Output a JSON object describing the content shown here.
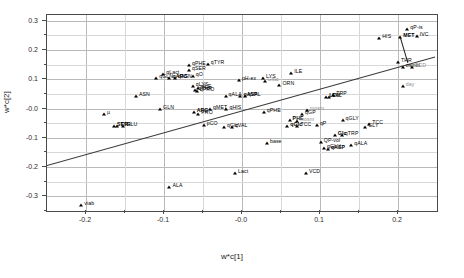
{
  "chart_data": {
    "type": "scatter",
    "title": "",
    "xlabel": "w*c[1]",
    "ylabel": "w*c[2]",
    "xlim": [
      -0.25,
      0.25
    ],
    "ylim": [
      -0.35,
      0.32
    ],
    "grid": true,
    "legend": "none",
    "xticks": [
      "-0.2",
      "-0.1",
      "-0.0",
      "0.1",
      "0.2"
    ],
    "xtick_values": [
      -0.2,
      -0.1,
      0.0,
      0.1,
      0.2
    ],
    "yticks": [
      "0.3",
      "0.2",
      "0.1",
      "-0.0",
      "-0.1",
      "-0.2",
      "-0.3"
    ],
    "ytick_values": [
      0.3,
      0.2,
      0.1,
      0.0,
      -0.1,
      -0.2,
      -0.3
    ],
    "annotations": {
      "trend_line": {
        "description": "diagonal regression line",
        "x_start": -0.25,
        "y_start": -0.2,
        "x_end": 0.25,
        "y_end": 0.175
      },
      "connector": {
        "description": "line segment connecting MET cluster to THR cluster",
        "x_start": 0.205,
        "y_start": 0.245,
        "x_end": 0.215,
        "y_end": 0.155
      }
    },
    "points": [
      {
        "label": "qP-is",
        "x": 0.212,
        "y": 0.272,
        "style": "plain"
      },
      {
        "label": "MET",
        "x": 0.203,
        "y": 0.245,
        "style": "bold"
      },
      {
        "label": "IVC",
        "x": 0.224,
        "y": 0.248,
        "style": "plain"
      },
      {
        "label": "HIS",
        "x": 0.176,
        "y": 0.243,
        "style": "plain"
      },
      {
        "label": "THR",
        "x": 0.2,
        "y": 0.158,
        "style": "plain"
      },
      {
        "label": "osmol",
        "x": 0.206,
        "y": 0.142,
        "style": "plain"
      },
      {
        "label": "TCD",
        "x": 0.218,
        "y": 0.142,
        "style": "grey"
      },
      {
        "label": "qTYR",
        "x": -0.044,
        "y": 0.152,
        "style": "plain"
      },
      {
        "label": "qPHE",
        "x": -0.068,
        "y": 0.15,
        "style": "plain"
      },
      {
        "label": "qSER",
        "x": -0.068,
        "y": 0.133,
        "style": "plain"
      },
      {
        "label": "qLact",
        "x": -0.101,
        "y": 0.118,
        "style": "plain"
      },
      {
        "label": "qO2",
        "x": -0.063,
        "y": 0.112,
        "style": "plain"
      },
      {
        "label": "qGLN",
        "x": -0.11,
        "y": 0.103,
        "style": "plain"
      },
      {
        "label": "qASN",
        "x": -0.086,
        "y": 0.103,
        "style": "plain"
      },
      {
        "label": "qARG",
        "x": -0.093,
        "y": 0.104,
        "style": "bold"
      },
      {
        "label": "ILE",
        "x": 0.063,
        "y": 0.122,
        "style": "plain"
      },
      {
        "label": "pH-ex",
        "x": -0.004,
        "y": 0.099,
        "style": "plain"
      },
      {
        "label": "LYS",
        "x": 0.027,
        "y": 0.103,
        "style": "plain"
      },
      {
        "label": "Gluc",
        "x": 0.029,
        "y": 0.094,
        "style": "grey"
      },
      {
        "label": "ORN",
        "x": 0.048,
        "y": 0.082,
        "style": "plain"
      },
      {
        "label": "qLYS",
        "x": -0.063,
        "y": 0.078,
        "style": "plain"
      },
      {
        "label": "qILE",
        "x": -0.057,
        "y": 0.07,
        "style": "plain"
      },
      {
        "label": "qTHR",
        "x": -0.06,
        "y": 0.064,
        "style": "plain"
      },
      {
        "label": "qPRO",
        "x": -0.058,
        "y": 0.059,
        "style": "plain"
      },
      {
        "label": "ASN",
        "x": -0.136,
        "y": 0.043,
        "style": "plain"
      },
      {
        "label": "qALA",
        "x": -0.021,
        "y": 0.042,
        "style": "plain"
      },
      {
        "label": "qASP",
        "x": -0.002,
        "y": 0.043,
        "style": "bold"
      },
      {
        "label": "qVAL",
        "x": 0.004,
        "y": 0.043,
        "style": "plain"
      },
      {
        "label": "TRP",
        "x": 0.117,
        "y": 0.046,
        "style": "plain"
      },
      {
        "label": "LEU",
        "x": 0.108,
        "y": 0.04,
        "style": "bold"
      },
      {
        "label": "VAL",
        "x": 0.112,
        "y": 0.04,
        "style": "plain"
      },
      {
        "label": "GLN",
        "x": -0.105,
        "y": -0.002,
        "style": "plain"
      },
      {
        "label": "qMET",
        "x": -0.041,
        "y": -0.002,
        "style": "plain"
      },
      {
        "label": "qHIS",
        "x": -0.02,
        "y": -0.002,
        "style": "plain"
      },
      {
        "label": "ARG",
        "x": -0.062,
        "y": -0.013,
        "style": "bold"
      },
      {
        "label": "PRO",
        "x": -0.056,
        "y": -0.017,
        "style": "plain"
      },
      {
        "label": "qPHE2",
        "x": 0.028,
        "y": -0.011,
        "style": "plain"
      },
      {
        "label": "mosm",
        "x": 0.083,
        "y": -0.004,
        "style": "grey"
      },
      {
        "label": "qGP",
        "x": 0.077,
        "y": -0.018,
        "style": "plain"
      },
      {
        "label": "µ",
        "x": -0.177,
        "y": -0.018,
        "style": "plain"
      },
      {
        "label": "SER",
        "x": -0.164,
        "y": -0.06,
        "style": "bold"
      },
      {
        "label": "TYR",
        "x": -0.16,
        "y": -0.058,
        "style": "plain"
      },
      {
        "label": "GLU",
        "x": -0.152,
        "y": -0.061,
        "style": "plain"
      },
      {
        "label": "pCO2",
        "x": -0.049,
        "y": -0.055,
        "style": "plain"
      },
      {
        "label": "qGlc",
        "x": -0.023,
        "y": -0.062,
        "style": "plain"
      },
      {
        "label": "qVAL2",
        "x": -0.013,
        "y": -0.064,
        "style": "plain"
      },
      {
        "label": "PHE",
        "x": 0.061,
        "y": -0.038,
        "style": "bold"
      },
      {
        "label": "mosm2",
        "x": 0.07,
        "y": -0.043,
        "style": "grey"
      },
      {
        "label": "qGlc2",
        "x": 0.058,
        "y": -0.058,
        "style": "bold"
      },
      {
        "label": "TCC",
        "x": 0.071,
        "y": -0.058,
        "style": "plain"
      },
      {
        "label": "qGLY",
        "x": 0.129,
        "y": -0.04,
        "style": "plain"
      },
      {
        "label": "TCC2",
        "x": 0.163,
        "y": -0.052,
        "style": "plain"
      },
      {
        "label": "GLY",
        "x": 0.158,
        "y": -0.062,
        "style": "plain"
      },
      {
        "label": "qP",
        "x": 0.096,
        "y": -0.057,
        "style": "plain"
      },
      {
        "label": "Glc",
        "x": 0.119,
        "y": -0.09,
        "style": "bold"
      },
      {
        "label": "qTRP",
        "x": 0.128,
        "y": -0.089,
        "style": "plain"
      },
      {
        "label": "QP-vol",
        "x": 0.101,
        "y": -0.113,
        "style": "plain"
      },
      {
        "label": "qALA2",
        "x": 0.14,
        "y": -0.124,
        "style": "plain"
      },
      {
        "label": "base",
        "x": 0.032,
        "y": -0.116,
        "style": "plain"
      },
      {
        "label": "qGLU",
        "x": 0.105,
        "y": -0.134,
        "style": "plain"
      },
      {
        "label": "qASP2",
        "x": 0.11,
        "y": -0.139,
        "style": "bold"
      },
      {
        "label": "Lact",
        "x": -0.009,
        "y": -0.219,
        "style": "plain"
      },
      {
        "label": "VCD",
        "x": 0.082,
        "y": -0.219,
        "style": "plain"
      },
      {
        "label": "ALA",
        "x": -0.093,
        "y": -0.268,
        "style": "plain"
      },
      {
        "label": "viab",
        "x": -0.206,
        "y": -0.33,
        "style": "plain"
      },
      {
        "label": "day",
        "x": 0.206,
        "y": 0.078,
        "style": "grey"
      }
    ]
  },
  "colors": {
    "axis": "#4a4a4a",
    "grid": "#b9b9b9",
    "point": "#000000",
    "grey_label": "#8e8e8e",
    "background": "#ffffff"
  }
}
